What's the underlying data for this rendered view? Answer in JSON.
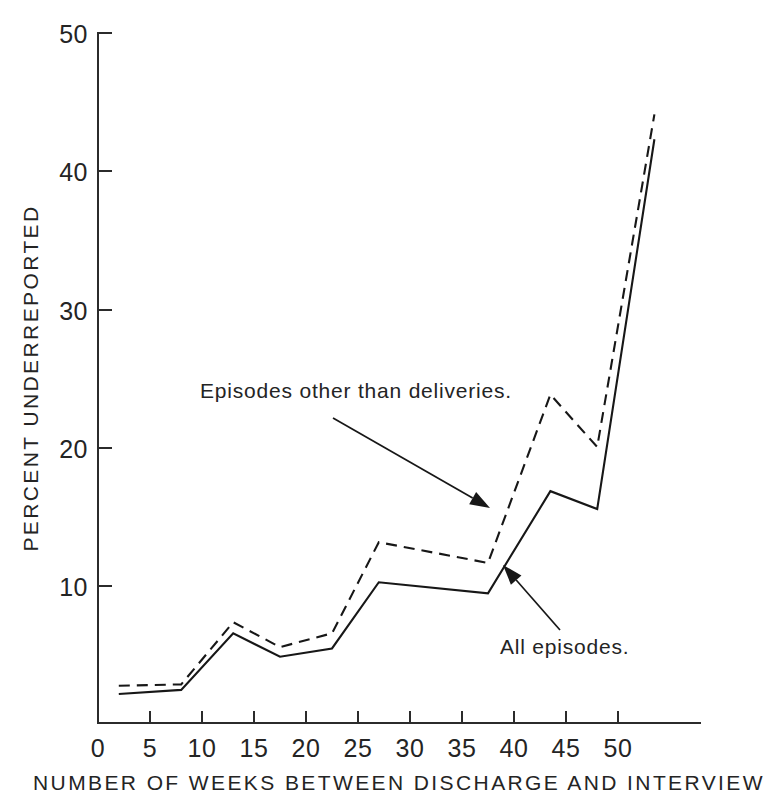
{
  "chart_data": {
    "type": "line",
    "title": "",
    "xlabel": "NUMBER OF WEEKS BETWEEN DISCHARGE AND INTERVIEW",
    "ylabel": "PERCENT UNDERREPORTED",
    "xlim": [
      0,
      55
    ],
    "ylim": [
      0,
      50
    ],
    "xticks": [
      0,
      5,
      10,
      15,
      20,
      25,
      30,
      35,
      40,
      45,
      50
    ],
    "yticks": [
      10,
      20,
      30,
      40,
      50
    ],
    "grid": false,
    "legend_position": "inline-annotations",
    "x": [
      2,
      8,
      13,
      17.5,
      22.5,
      27,
      37.5,
      43.5,
      48,
      53.5
    ],
    "series": [
      {
        "name": "All episodes.",
        "style": "solid",
        "values": [
          2.1,
          2.4,
          6.5,
          4.8,
          5.4,
          10.2,
          9.4,
          16.8,
          15.5,
          42.3
        ]
      },
      {
        "name": "Episodes other than deliveries.",
        "style": "dashed",
        "values": [
          2.7,
          2.8,
          7.3,
          5.5,
          6.5,
          13.1,
          11.6,
          23.8,
          20.0,
          44.1
        ]
      }
    ],
    "annotations": [
      {
        "text": "Episodes other than deliveries.",
        "target_series": "Episodes other than deliveries.",
        "text_x": 200,
        "text_y": 398,
        "arrow_from_x": 333,
        "arrow_from_y": 418,
        "arrow_to_x": 490,
        "arrow_to_y": 508
      },
      {
        "text": "All episodes.",
        "target_series": "All episodes.",
        "text_x": 500,
        "text_y": 654,
        "arrow_from_x": 560,
        "arrow_from_y": 630,
        "arrow_to_x": 503,
        "arrow_to_y": 565
      }
    ]
  },
  "axes": {
    "x_tick_labels": [
      "0",
      "5",
      "10",
      "15",
      "20",
      "25",
      "30",
      "35",
      "40",
      "45",
      "50"
    ],
    "y_tick_labels": [
      "10",
      "20",
      "30",
      "40",
      "50"
    ],
    "x_title": "NUMBER OF WEEKS BETWEEN DISCHARGE AND INTERVIEW",
    "y_title": "PERCENT UNDERREPORTED"
  },
  "colors": {
    "line": "#171717",
    "axis": "#2b2b2b",
    "text": "#242424",
    "background": "#ffffff"
  }
}
